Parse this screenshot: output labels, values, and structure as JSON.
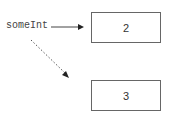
{
  "variable": {
    "name": "someInt"
  },
  "boxes": [
    {
      "value": "2"
    },
    {
      "value": "3"
    }
  ],
  "arrows": [
    {
      "style": "solid",
      "from": "someInt",
      "to": "box-0"
    },
    {
      "style": "dashed",
      "from": "someInt",
      "to": "box-1"
    }
  ],
  "colors": {
    "stroke": "#444444",
    "text": "#333333"
  }
}
